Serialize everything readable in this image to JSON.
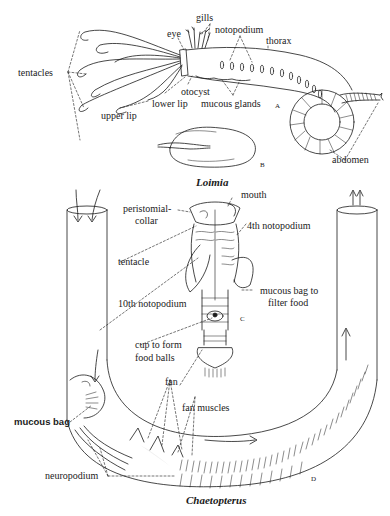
{
  "figure": {
    "panels": [
      {
        "id": "A",
        "organism": "Loimia",
        "labels": {
          "tentacles": "tentacles",
          "upper_lip": "upper lip",
          "eye": "eye",
          "gills": "gills",
          "notopodium": "notopodium",
          "thorax": "thorax",
          "otocyst": "otocyst",
          "lower_lip": "lower lip",
          "mucous_glands": "mucous glands",
          "abdomen": "abdomen"
        },
        "panel_letter": "A"
      },
      {
        "id": "B",
        "organism": "Loimia",
        "panel_letter": "B"
      },
      {
        "id": "C",
        "organism": "Chaetopterus",
        "labels": {
          "mouth": "mouth",
          "peristomial_collar_1": "peristomial-",
          "peristomial_collar_2": "collar",
          "fourth_notopodium": "4th notopodium",
          "tentacle": "tentacle",
          "mucous_bag_filter_1": "mucous bag to",
          "mucous_bag_filter_2": "filter food",
          "tenth_notopodium": "10th notopodium",
          "cup_1": "cup to form",
          "cup_2": "food balls"
        },
        "panel_letter": "C"
      },
      {
        "id": "D",
        "organism": "Chaetopterus",
        "labels": {
          "fan": "fan",
          "fan_muscles": "fan muscles",
          "mucous_bag": "mucous bag",
          "neuropodium": "neuropodium"
        },
        "panel_letter": "D"
      }
    ],
    "titles": {
      "loimia": "Loimia",
      "chaetopterus": "Chaetopterus"
    },
    "colors": {
      "ink": "#1a1a1a",
      "paper": "#ffffff",
      "stipple": "#bdbdbd"
    }
  }
}
